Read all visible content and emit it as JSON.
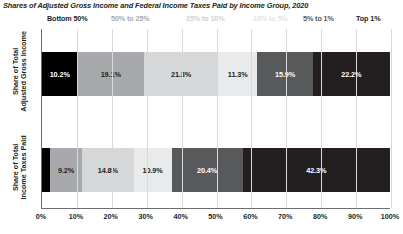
{
  "chart_data": {
    "type": "bar",
    "orientation": "horizontal",
    "stacked": true,
    "title": "Shares of Adjusted Gross Income and Federal Income Taxes Paid  by Income Group, 2020",
    "xlabel": "",
    "ylabel": "",
    "xlim": [
      0,
      100
    ],
    "grid": true,
    "legend_position": "top",
    "categories": [
      "Share of Total Adjusted Gross Income",
      "Share of Total Income Taxes Paid"
    ],
    "series": [
      {
        "name": "Bottom 50%",
        "values": [
          10.2,
          2.3
        ],
        "color": "#000000",
        "label_color": "#ffffff"
      },
      {
        "name": "50% to 25%",
        "values": [
          19.1,
          9.2
        ],
        "color": "#a7a9ac",
        "label_color": "#231f20"
      },
      {
        "name": "25% to 10%",
        "values": [
          21.3,
          14.8
        ],
        "color": "#d5d7d8",
        "label_color": "#231f20"
      },
      {
        "name": "10% to 5%",
        "values": [
          11.3,
          10.9
        ],
        "color": "#e9eaeb",
        "label_color": "#231f20"
      },
      {
        "name": "5% to 1%",
        "values": [
          15.9,
          20.4
        ],
        "color": "#58595b",
        "label_color": "#ffffff"
      },
      {
        "name": "Top 1%",
        "values": [
          22.2,
          42.3
        ],
        "color": "#231f20",
        "label_color": "#ffffff"
      }
    ],
    "bar_labels": [
      [
        "10.2%",
        "19.1%",
        "21.3%",
        "11.3%",
        "15.9%",
        "22.2%"
      ],
      [
        "",
        "9.2%",
        "14.8%",
        "10.9%",
        "20.4%",
        "42.3%"
      ]
    ],
    "xticks": [
      "0%",
      "10%",
      "20%",
      "30%",
      "40%",
      "50%",
      "60%",
      "70%",
      "80%",
      "90%",
      "100%"
    ],
    "xtick_values": [
      0,
      10,
      20,
      30,
      40,
      50,
      60,
      70,
      80,
      90,
      100
    ]
  },
  "legend": {
    "items": [
      {
        "label": "Bottom 50%",
        "color": "#231f20"
      },
      {
        "label": "50% to 25%",
        "color": "#a7a9ac"
      },
      {
        "label": "25% to 10%",
        "color": "#cfd1d2"
      },
      {
        "label": "10% to 5%",
        "color": "#e2e3e4"
      },
      {
        "label": "5% to 1%",
        "color": "#58595b"
      },
      {
        "label": "Top 1%",
        "color": "#231f20"
      }
    ]
  },
  "axes": {
    "y_labels": [
      {
        "line1": "Share of Total",
        "line2": "Adjusted Gross Income"
      },
      {
        "line1": "Share of Total",
        "line2": "Income Taxes Paid"
      }
    ]
  }
}
